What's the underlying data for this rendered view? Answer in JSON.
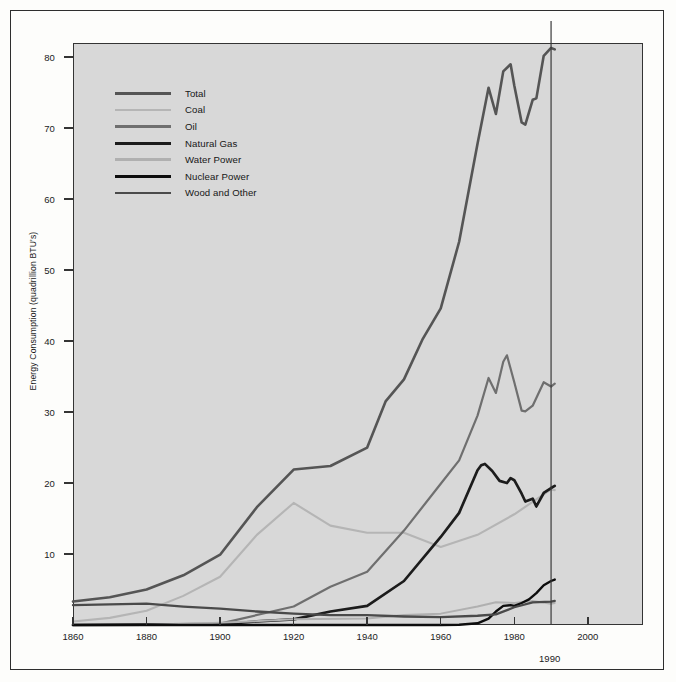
{
  "chart_data": {
    "type": "line",
    "title": "",
    "xlabel": "",
    "ylabel": "Energy Consumption (quadrillion BTU's)",
    "xlim": [
      1860,
      2015
    ],
    "ylim": [
      0,
      82
    ],
    "grid": false,
    "legend_position": "upper-left",
    "x_ticks": [
      1860,
      1880,
      1900,
      1920,
      1940,
      1960,
      1980,
      2000
    ],
    "x_tick_labels": [
      "1860",
      "1880",
      "1900",
      "1920",
      "1940",
      "1960",
      "1980",
      "2000"
    ],
    "y_ticks": [
      10,
      20,
      30,
      40,
      50,
      60,
      70,
      80
    ],
    "y_tick_labels": [
      "10",
      "20",
      "30",
      "40",
      "50",
      "60",
      "70",
      "80"
    ],
    "annotations": [
      {
        "name": "marker-1990",
        "label": "1990",
        "x": 1990,
        "type": "vertical-line"
      }
    ],
    "series": [
      {
        "name": "Total",
        "color": "#555555",
        "width": 2.6,
        "x": [
          1860,
          1870,
          1880,
          1890,
          1900,
          1910,
          1920,
          1930,
          1940,
          1945,
          1950,
          1955,
          1960,
          1965,
          1970,
          1973,
          1975,
          1977,
          1979,
          1980,
          1982,
          1983,
          1985,
          1986,
          1988,
          1990,
          1991
        ],
        "y": [
          3.3,
          3.9,
          5.0,
          7.0,
          9.9,
          16.6,
          21.9,
          22.4,
          25.0,
          31.5,
          34.6,
          40.2,
          44.6,
          54.0,
          67.8,
          75.7,
          72.0,
          78.0,
          79.0,
          76.0,
          70.8,
          70.5,
          74.0,
          74.2,
          80.2,
          81.3,
          81.1
        ]
      },
      {
        "name": "Coal",
        "color": "#b5b5b5",
        "width": 2.1,
        "x": [
          1860,
          1870,
          1880,
          1890,
          1900,
          1910,
          1920,
          1930,
          1940,
          1950,
          1960,
          1970,
          1980,
          1990,
          1991
        ],
        "y": [
          0.5,
          1.0,
          2.0,
          4.1,
          6.8,
          12.7,
          17.2,
          14.0,
          13.0,
          13.0,
          11.0,
          12.7,
          15.6,
          19.1,
          19.0
        ]
      },
      {
        "name": "Oil",
        "color": "#6f6f6f",
        "width": 2.2,
        "x": [
          1860,
          1880,
          1900,
          1920,
          1930,
          1940,
          1950,
          1960,
          1965,
          1970,
          1973,
          1975,
          1977,
          1978,
          1980,
          1982,
          1983,
          1985,
          1988,
          1990,
          1991
        ],
        "y": [
          0.0,
          0.1,
          0.2,
          2.6,
          5.4,
          7.5,
          13.3,
          19.9,
          23.2,
          29.5,
          34.8,
          32.7,
          37.1,
          38.0,
          34.2,
          30.2,
          30.1,
          30.9,
          34.2,
          33.6,
          34.0
        ]
      },
      {
        "name": "Natural Gas",
        "color": "#1c1c1c",
        "width": 2.7,
        "x": [
          1860,
          1900,
          1910,
          1920,
          1930,
          1940,
          1950,
          1960,
          1965,
          1970,
          1971,
          1972,
          1974,
          1976,
          1978,
          1979,
          1980,
          1982,
          1983,
          1985,
          1986,
          1988,
          1990,
          1991
        ],
        "y": [
          0.0,
          0.1,
          0.5,
          0.8,
          1.9,
          2.7,
          6.2,
          12.4,
          15.8,
          21.8,
          22.5,
          22.7,
          21.7,
          20.3,
          20.0,
          20.7,
          20.4,
          18.5,
          17.4,
          17.8,
          16.7,
          18.6,
          19.3,
          19.6
        ]
      },
      {
        "name": "Water Power",
        "color": "#b0b0b0",
        "width": 2.0,
        "x": [
          1860,
          1880,
          1900,
          1920,
          1940,
          1950,
          1960,
          1970,
          1975,
          1980,
          1985,
          1990,
          1991
        ],
        "y": [
          0.0,
          0.0,
          0.3,
          0.8,
          0.9,
          1.4,
          1.6,
          2.6,
          3.2,
          3.1,
          3.4,
          3.0,
          3.1
        ]
      },
      {
        "name": "Nuclear Power",
        "color": "#0d0d0d",
        "width": 2.4,
        "x": [
          1860,
          1955,
          1960,
          1965,
          1970,
          1973,
          1975,
          1977,
          1979,
          1980,
          1982,
          1984,
          1986,
          1988,
          1990,
          1991
        ],
        "y": [
          0.0,
          0.0,
          0.0,
          0.04,
          0.24,
          0.91,
          1.9,
          2.7,
          2.8,
          2.7,
          3.1,
          3.6,
          4.5,
          5.6,
          6.2,
          6.4
        ]
      },
      {
        "name": "Wood and Other",
        "color": "#4a4a4a",
        "width": 2.3,
        "x": [
          1860,
          1870,
          1880,
          1890,
          1900,
          1910,
          1920,
          1930,
          1940,
          1950,
          1960,
          1970,
          1975,
          1980,
          1985,
          1990,
          1991
        ],
        "y": [
          2.8,
          2.9,
          3.0,
          2.6,
          2.3,
          1.9,
          1.6,
          1.4,
          1.4,
          1.2,
          1.1,
          1.3,
          1.5,
          2.5,
          3.2,
          3.3,
          3.4
        ]
      }
    ]
  },
  "legend": {
    "items": [
      {
        "label": "Total"
      },
      {
        "label": "Coal"
      },
      {
        "label": "Oil"
      },
      {
        "label": "Natural Gas"
      },
      {
        "label": "Water Power"
      },
      {
        "label": "Nuclear Power"
      },
      {
        "label": "Wood and Other"
      }
    ]
  }
}
